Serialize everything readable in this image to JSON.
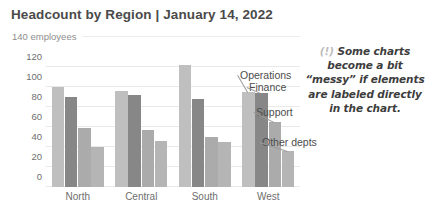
{
  "title": "Headcount by Region | January 14, 2022",
  "subtitle": "140 employees",
  "callout": {
    "marker": "(!)",
    "line1": "Some charts",
    "line2": "become a bit",
    "line3": "“messy” if elements",
    "line4": "are labeled directly",
    "line5": "in the chart."
  },
  "colors": {
    "operations": "#bfbfbf",
    "finance": "#878787",
    "support": "#ababab",
    "other": "#b5b5b5",
    "title": "#4a4a4a",
    "subtitle": "#8e8e8e",
    "tick": "#6e6e6e",
    "grid": "#e9e9e9",
    "leader": "#9a9a9a",
    "callout_marker": "#bdbdbd"
  },
  "chart_data": {
    "type": "bar",
    "title": "Headcount by Region | January 14, 2022",
    "subtitle": "140 employees",
    "xlabel": "",
    "ylabel": "employees",
    "ylim": [
      0,
      140
    ],
    "yticks": [
      0,
      20,
      40,
      60,
      80,
      100,
      120
    ],
    "ytick_labels": [
      "0",
      "20",
      "40",
      "60",
      "80",
      "100",
      "120"
    ],
    "grid": true,
    "legend": "direct-labels-in-chart",
    "categories": [
      "North",
      "Central",
      "South",
      "West"
    ],
    "series": [
      {
        "name": "Operations",
        "values": [
          100,
          96,
          122,
          95
        ],
        "color": "#bfbfbf"
      },
      {
        "name": "Finance",
        "values": [
          90,
          92,
          88,
          94
        ],
        "color": "#878787"
      },
      {
        "name": "Support",
        "values": [
          59,
          57,
          50,
          65
        ],
        "color": "#ababab"
      },
      {
        "name": "Other depts",
        "values": [
          40,
          46,
          45,
          36
        ],
        "color": "#b5b5b5"
      }
    ],
    "annotations": [
      {
        "text": "Operations",
        "target_group": "West",
        "target_series": "Operations"
      },
      {
        "text": "Finance",
        "target_group": "West",
        "target_series": "Finance"
      },
      {
        "text": "Support",
        "target_group": "West",
        "target_series": "Support"
      },
      {
        "text": "Other depts",
        "target_group": "West",
        "target_series": "Other depts"
      }
    ]
  }
}
